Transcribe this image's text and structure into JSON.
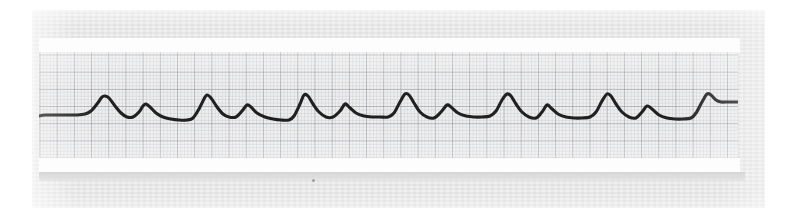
{
  "figure": {
    "kind": "ecg-rhythm-strip",
    "caption": "ECG rhythm strip",
    "paper_label": "",
    "speck_artifact": "scan-speck"
  },
  "colors": {
    "page_background": "#ffffff",
    "backing_card": "#e6e6e6",
    "white_band": "#fdfdfd",
    "strip_paper": "#ededed",
    "grid_major": "#787d87",
    "grid_minor": "#969ba5",
    "trace_ink": "#141414",
    "shadow_band": "#d2d2d2"
  },
  "layout": {
    "image_width": 798,
    "image_height": 218,
    "backing_card": {
      "x": 32,
      "y": 10,
      "w": 733,
      "h": 198
    },
    "strip": {
      "x": 39,
      "y": 52,
      "w": 699,
      "h": 107
    },
    "white_band_top": {
      "x": 39,
      "y": 38,
      "w": 701,
      "h": 15
    },
    "white_band_bottom": {
      "x": 39,
      "y": 158,
      "w": 701,
      "h": 14
    },
    "grid_major_px": 17.2,
    "grid_minor_px": 3.44
  },
  "chart_data": {
    "type": "line",
    "subtitle": "Alternating large and small complexes (pulsus alternans / bigeminal pattern)",
    "xlabel": "Time",
    "ylabel": "Amplitude",
    "grid": true,
    "grid_major_boxes": "5 x 5 minor squares",
    "legend": "none",
    "xlim": [
      0,
      699
    ],
    "ylim": [
      0,
      107
    ],
    "baseline_y": 62,
    "units": {
      "x": "small square = 0.04 s (major square = 0.20 s)",
      "y": "small square = 0.1 mV (major square = 0.5 mV)"
    },
    "annotations": [],
    "beats": [
      {
        "index": 1,
        "type": "large",
        "peak_x": 66,
        "peak_y": 44
      },
      {
        "index": 2,
        "type": "small",
        "peak_x": 106,
        "peak_y": 52
      },
      {
        "index": 3,
        "type": "large",
        "peak_x": 168,
        "peak_y": 43
      },
      {
        "index": 4,
        "type": "small",
        "peak_x": 208,
        "peak_y": 52
      },
      {
        "index": 5,
        "type": "large",
        "peak_x": 266,
        "peak_y": 42
      },
      {
        "index": 6,
        "type": "small",
        "peak_x": 306,
        "peak_y": 52
      },
      {
        "index": 7,
        "type": "large",
        "peak_x": 368,
        "peak_y": 42
      },
      {
        "index": 8,
        "type": "small",
        "peak_x": 408,
        "peak_y": 53
      },
      {
        "index": 9,
        "type": "large",
        "peak_x": 468,
        "peak_y": 42
      },
      {
        "index": 10,
        "type": "small",
        "peak_x": 508,
        "peak_y": 53
      },
      {
        "index": 11,
        "type": "large",
        "peak_x": 568,
        "peak_y": 42
      },
      {
        "index": 12,
        "type": "small",
        "peak_x": 608,
        "peak_y": 54
      },
      {
        "index": 13,
        "type": "large",
        "peak_x": 668,
        "peak_y": 42
      }
    ],
    "series": [
      {
        "name": "Lead II rhythm strip",
        "color": "#141414",
        "points": [
          [
            0,
            64
          ],
          [
            6,
            63
          ],
          [
            14,
            63
          ],
          [
            22,
            63
          ],
          [
            30,
            63
          ],
          [
            38,
            63
          ],
          [
            46,
            62
          ],
          [
            52,
            59
          ],
          [
            58,
            52
          ],
          [
            63,
            45
          ],
          [
            66,
            44
          ],
          [
            70,
            46
          ],
          [
            76,
            54
          ],
          [
            82,
            61
          ],
          [
            88,
            65
          ],
          [
            94,
            65
          ],
          [
            100,
            60
          ],
          [
            104,
            54
          ],
          [
            107,
            52
          ],
          [
            111,
            55
          ],
          [
            117,
            61
          ],
          [
            124,
            65
          ],
          [
            132,
            67
          ],
          [
            140,
            68
          ],
          [
            148,
            68
          ],
          [
            154,
            66
          ],
          [
            160,
            57
          ],
          [
            165,
            47
          ],
          [
            168,
            43
          ],
          [
            172,
            46
          ],
          [
            178,
            55
          ],
          [
            184,
            62
          ],
          [
            190,
            65
          ],
          [
            197,
            65
          ],
          [
            203,
            59
          ],
          [
            208,
            53
          ],
          [
            212,
            55
          ],
          [
            218,
            61
          ],
          [
            226,
            65
          ],
          [
            234,
            67
          ],
          [
            242,
            68
          ],
          [
            250,
            68
          ],
          [
            255,
            64
          ],
          [
            261,
            52
          ],
          [
            265,
            43
          ],
          [
            269,
            44
          ],
          [
            274,
            52
          ],
          [
            280,
            60
          ],
          [
            287,
            65
          ],
          [
            294,
            65
          ],
          [
            301,
            59
          ],
          [
            306,
            52
          ],
          [
            310,
            55
          ],
          [
            317,
            61
          ],
          [
            325,
            64
          ],
          [
            333,
            65
          ],
          [
            341,
            65
          ],
          [
            349,
            65
          ],
          [
            355,
            61
          ],
          [
            361,
            50
          ],
          [
            366,
            42
          ],
          [
            370,
            43
          ],
          [
            375,
            51
          ],
          [
            381,
            60
          ],
          [
            388,
            65
          ],
          [
            395,
            66
          ],
          [
            402,
            60
          ],
          [
            408,
            53
          ],
          [
            412,
            55
          ],
          [
            419,
            61
          ],
          [
            427,
            64
          ],
          [
            435,
            65
          ],
          [
            443,
            65
          ],
          [
            451,
            64
          ],
          [
            457,
            59
          ],
          [
            463,
            48
          ],
          [
            468,
            42
          ],
          [
            472,
            44
          ],
          [
            477,
            52
          ],
          [
            483,
            60
          ],
          [
            490,
            65
          ],
          [
            497,
            66
          ],
          [
            503,
            60
          ],
          [
            508,
            53
          ],
          [
            512,
            56
          ],
          [
            519,
            62
          ],
          [
            527,
            65
          ],
          [
            535,
            66
          ],
          [
            543,
            66
          ],
          [
            551,
            65
          ],
          [
            557,
            60
          ],
          [
            563,
            49
          ],
          [
            568,
            42
          ],
          [
            572,
            44
          ],
          [
            577,
            52
          ],
          [
            583,
            60
          ],
          [
            590,
            65
          ],
          [
            597,
            66
          ],
          [
            603,
            60
          ],
          [
            608,
            54
          ],
          [
            613,
            57
          ],
          [
            620,
            63
          ],
          [
            628,
            66
          ],
          [
            636,
            67
          ],
          [
            644,
            67
          ],
          [
            652,
            66
          ],
          [
            657,
            61
          ],
          [
            663,
            50
          ],
          [
            668,
            42
          ],
          [
            672,
            43
          ],
          [
            677,
            48
          ],
          [
            682,
            50
          ],
          [
            688,
            50
          ],
          [
            694,
            50
          ],
          [
            699,
            50
          ]
        ]
      }
    ]
  }
}
